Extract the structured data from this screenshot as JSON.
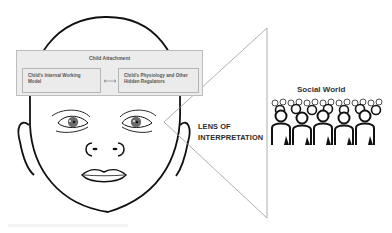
{
  "diagram": {
    "child_attachment": {
      "title": "Child Attachment",
      "internal_working_model": "Child's Internal Working Model",
      "physiology": "Child's Physiology and Other Hidden Regulators",
      "relation": "bidirectional-arrow"
    },
    "lens": {
      "line1": "LENS OF",
      "line2": "INTERPRETATION"
    },
    "social_world": {
      "title": "Social World",
      "icon": "crowd-icon"
    },
    "face": {
      "icon": "baby-face-icon"
    },
    "colors": {
      "outline": "#111111",
      "box_fill": "#ececec",
      "box_border": "#bdbdbd",
      "lens_line": "#9a9a9a",
      "iris": "#6b6b6b"
    }
  }
}
